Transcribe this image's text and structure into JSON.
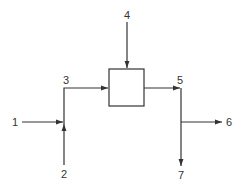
{
  "diagram": {
    "type": "process-flow",
    "unit": {
      "name": "process-unit"
    },
    "streams": [
      {
        "id": "1",
        "label": "1",
        "direction": "in",
        "description": "feed to mixing point"
      },
      {
        "id": "2",
        "label": "2",
        "direction": "in",
        "description": "feed to mixing point from below"
      },
      {
        "id": "3",
        "label": "3",
        "direction": "internal",
        "description": "mixed stream into unit"
      },
      {
        "id": "4",
        "label": "4",
        "direction": "in",
        "description": "feed into unit from top"
      },
      {
        "id": "5",
        "label": "5",
        "direction": "internal",
        "description": "unit outlet to splitter"
      },
      {
        "id": "6",
        "label": "6",
        "direction": "out",
        "description": "product stream"
      },
      {
        "id": "7",
        "label": "7",
        "direction": "out",
        "description": "product stream downward"
      }
    ]
  },
  "colors": {
    "line": "#333333",
    "background": "#ffffff"
  }
}
